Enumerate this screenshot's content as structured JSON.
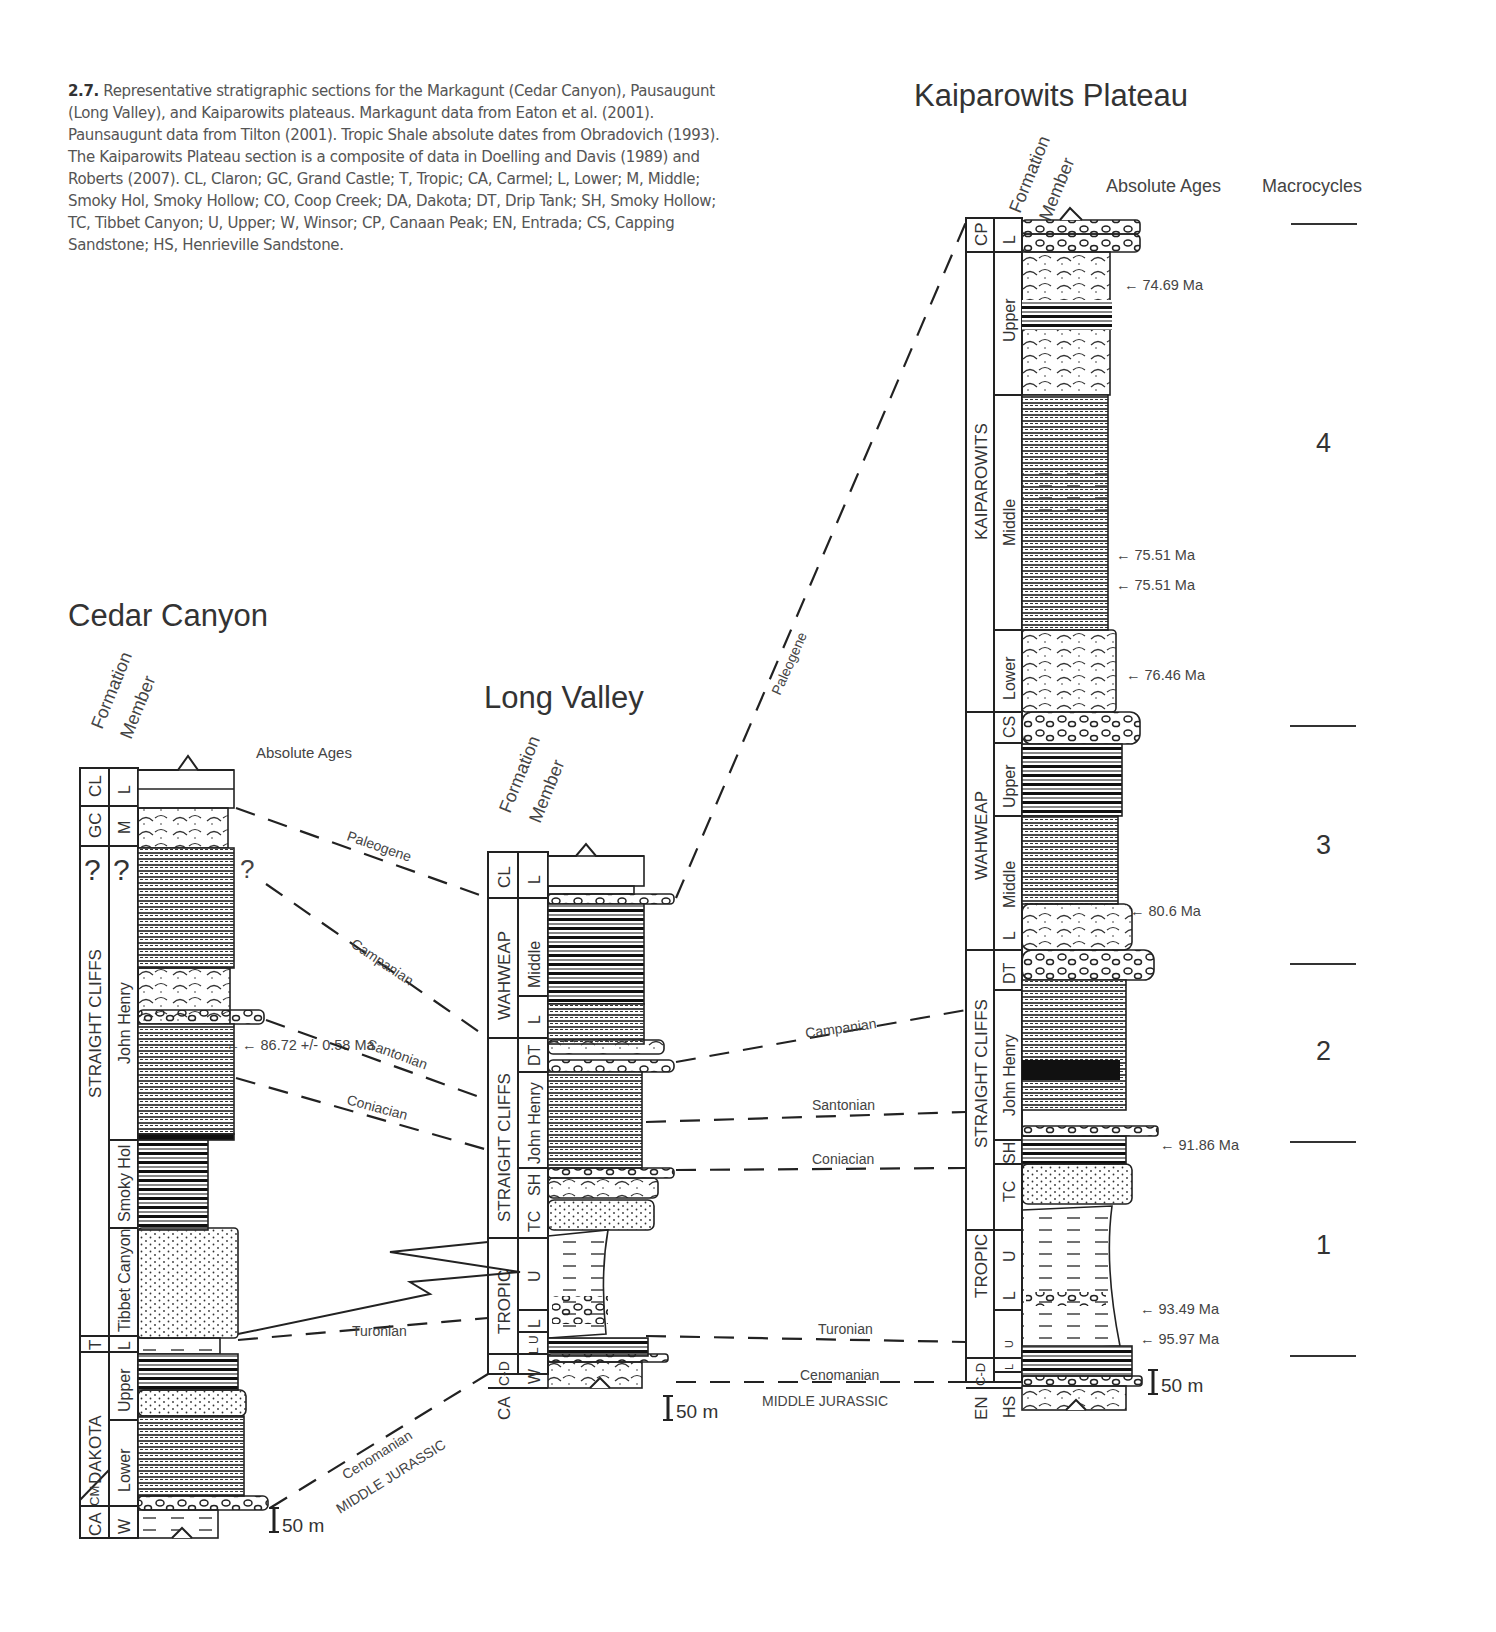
{
  "caption": {
    "figure_number": "2.7.",
    "text": "Representative stratigraphic sections for the Markagunt (Cedar Canyon), Pausaugunt (Long Valley), and Kaiparowits plateaus. Markagunt data from Eaton et al. (2001). Paunsaugunt data from Tilton (2001). Tropic Shale absolute dates from Obradovich (1993). The Kaiparowits Plateau section is a composite of data in Doelling and Davis (1989) and Roberts (2007). CL, Claron; GC, Grand Castle; T, Tropic; CA, Carmel; L, Lower; M, Middle; Smoky Hol, Smoky Hollow; CO, Coop Creek; DA, Dakota; DT, Drip Tank; SH, Smoky Hollow; TC, Tibbet Canyon; U, Upper; W, Winsor; CP, Canaan Peak; EN, Entrada; CS, Capping Sandstone; HS, Henrieville Sandstone."
  },
  "headers": {
    "formation": "Formation",
    "member": "Member",
    "absolute_ages": "Absolute Ages",
    "macrocycles": "Macrocycles"
  },
  "sections": {
    "cedar": {
      "title": "Cedar Canyon",
      "formations": [
        "CL",
        "GC",
        "?",
        "STRAIGHT CLIFFS",
        "T",
        "DAKOTA",
        "CM",
        "CA"
      ],
      "members": [
        "L",
        "M",
        "?",
        "John Henry",
        "Smoky Hol",
        "Tibbet Canyon",
        "L",
        "Upper",
        "Lower",
        "W"
      ],
      "ages": [
        "86.72 +/- 0.58 Ma"
      ],
      "question_mark": "?",
      "scale": "50 m"
    },
    "long": {
      "title": "Long Valley",
      "formations": [
        "CL",
        "WAHWEAP",
        "STRAIGHT CLIFFS",
        "TROPIC",
        "C-D",
        "CA"
      ],
      "members": [
        "L",
        "Middle",
        "L",
        "DT",
        "John Henry",
        "SH",
        "TC",
        "U",
        "L",
        "U",
        "L",
        "W"
      ],
      "scale": "50 m"
    },
    "kaip": {
      "title": "Kaiparowits Plateau",
      "formations": [
        "CP",
        "KAIPAROWITS",
        "WAHWEAP",
        "STRAIGHT CLIFFS",
        "TROPIC",
        "C-D",
        "EN"
      ],
      "members": [
        "L",
        "Upper",
        "Middle",
        "Lower",
        "CS",
        "Upper",
        "Middle",
        "L",
        "DT",
        "John Henry",
        "SH",
        "TC",
        "U",
        "L",
        "U",
        "L",
        "HS"
      ],
      "ages": [
        "74.69 Ma",
        "75.51 Ma",
        "75.51 Ma",
        "76.46 Ma",
        "80.6 Ma",
        "91.86 Ma",
        "93.49 Ma",
        "95.97 Ma"
      ],
      "scale": "50 m"
    }
  },
  "correlations": {
    "cedar_long": [
      "Paleogene",
      "Campanian",
      "Santonian",
      "Coniacian",
      "Turonian",
      "Cenomanian",
      "MIDDLE JURASSIC"
    ],
    "long_kaip": [
      "Paleogene",
      "Campanian",
      "Santonian",
      "Coniacian",
      "Turonian",
      "Cenomanian",
      "MIDDLE JURASSIC"
    ]
  },
  "macrocycles": [
    "4",
    "3",
    "2",
    "1"
  ]
}
